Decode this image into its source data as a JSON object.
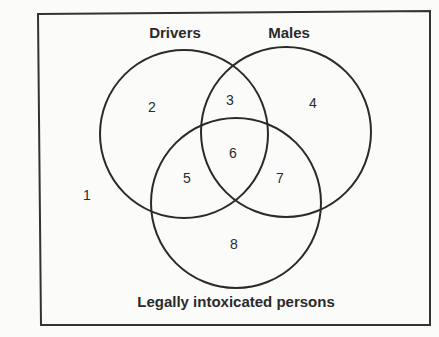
{
  "diagram": {
    "type": "venn",
    "frame": {
      "x1": 38,
      "y1": 12,
      "x2": 430,
      "y2": 324,
      "stroke": "#333333"
    },
    "sets": [
      {
        "id": "drivers",
        "label": "Drivers",
        "cx": 184,
        "cy": 134,
        "r": 84,
        "label_x": 175,
        "label_y": 38
      },
      {
        "id": "males",
        "label": "Males",
        "cx": 286,
        "cy": 132,
        "r": 85,
        "label_x": 289,
        "label_y": 38
      },
      {
        "id": "intoxicated",
        "label": "Legally intoxicated persons",
        "cx": 236,
        "cy": 203,
        "r": 85,
        "label_x": 236,
        "label_y": 307
      }
    ],
    "regions": [
      {
        "id": "1",
        "label": "1",
        "x": 87,
        "y": 200,
        "description": "outside all sets"
      },
      {
        "id": "2",
        "label": "2",
        "x": 152,
        "y": 112,
        "description": "drivers only"
      },
      {
        "id": "3",
        "label": "3",
        "x": 230,
        "y": 105,
        "description": "drivers and males, not intoxicated"
      },
      {
        "id": "4",
        "label": "4",
        "x": 313,
        "y": 108,
        "description": "males only"
      },
      {
        "id": "5",
        "label": "5",
        "x": 187,
        "y": 183,
        "description": "drivers and intoxicated, not males"
      },
      {
        "id": "6",
        "label": "6",
        "x": 233,
        "y": 158,
        "description": "drivers, males and intoxicated"
      },
      {
        "id": "7",
        "label": "7",
        "x": 280,
        "y": 183,
        "description": "males and intoxicated, not drivers"
      },
      {
        "id": "8",
        "label": "8",
        "x": 234,
        "y": 249,
        "description": "intoxicated only"
      }
    ]
  }
}
